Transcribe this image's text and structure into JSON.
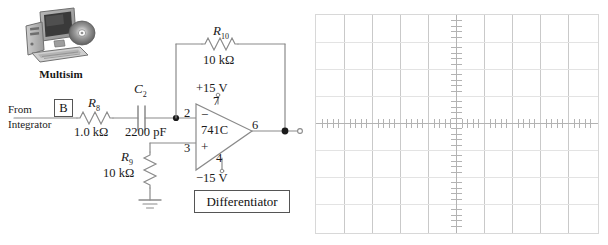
{
  "figure": {
    "kind": "circuit-schematic-with-oscilloscope",
    "brand": {
      "caption": "Multisim",
      "icon": "computer-monitor-tower-cd-keyboard-icon"
    },
    "title_box": "Differentiator"
  },
  "circuit": {
    "input": {
      "line1": "From",
      "line2": "Integrator",
      "node_tag": "B"
    },
    "components": [
      {
        "ref": "R",
        "sub": "8",
        "value": "1.0 kΩ",
        "type": "resistor-horizontal"
      },
      {
        "ref": "C",
        "sub": "2",
        "value": "2200 pF",
        "type": "capacitor"
      },
      {
        "ref": "R",
        "sub": "9",
        "value": "10 kΩ",
        "type": "resistor-vertical"
      },
      {
        "ref": "R",
        "sub": "10",
        "value": "10 kΩ",
        "type": "resistor-feedback"
      }
    ],
    "opamp": {
      "part": "741C",
      "pins": {
        "inverting": "2",
        "noninverting": "3",
        "vplus": "7",
        "vminus": "4",
        "output": "6"
      },
      "supplies": {
        "positive": "+15 V",
        "negative": "−15 V"
      },
      "symbols": {
        "minus": "−",
        "plus": "+"
      }
    },
    "ground": "ground-symbol"
  },
  "scope": {
    "name": "oscilloscope-graticule",
    "divisions_x": 10,
    "divisions_y": 8,
    "trace": "none",
    "colors": {
      "grid": "#c9c9c9",
      "grid_soft": "#e3e3e3",
      "axis": "#b3b3b3",
      "border": "#d8d8d8"
    }
  },
  "colors": {
    "wire": "#8a8a8a",
    "ink": "#1a1a1a",
    "box_border": "#555555"
  }
}
